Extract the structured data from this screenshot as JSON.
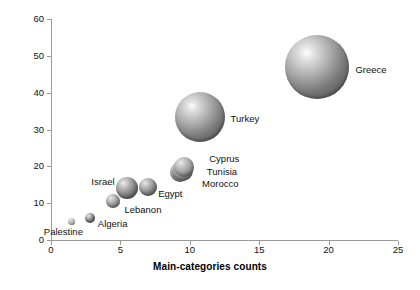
{
  "chart_data": {
    "type": "scatter",
    "title": "",
    "xlabel": "Main-categories counts",
    "ylabel": "Sub-categories counts",
    "xlim": [
      0,
      25
    ],
    "ylim": [
      0,
      60
    ],
    "xticks": [
      0,
      5,
      10,
      15,
      20,
      25
    ],
    "yticks": [
      0,
      10,
      20,
      30,
      40,
      50,
      60
    ],
    "grid": false,
    "legend": "none",
    "marker_style": "shaded-sphere-bubble",
    "points": [
      {
        "label": "Palestine",
        "x": 1.5,
        "y": 5,
        "r_px": 3.5,
        "label_dx": -28,
        "label_dy": 10,
        "shade": "#c9c9c9"
      },
      {
        "label": "Algeria",
        "x": 2.8,
        "y": 6,
        "r_px": 5.0,
        "label_dx": 8,
        "label_dy": 6,
        "shade": "#6e6e6e"
      },
      {
        "label": "Lebanon",
        "x": 4.5,
        "y": 10.5,
        "r_px": 7.0,
        "label_dx": 11,
        "label_dy": 9,
        "shade": "#8a8a8a"
      },
      {
        "label": "Israel",
        "x": 5.5,
        "y": 14,
        "r_px": 11.0,
        "label_dx": -36,
        "label_dy": -6,
        "shade": "#707070"
      },
      {
        "label": "Egypt",
        "x": 7.0,
        "y": 14.5,
        "r_px": 9.0,
        "label_dx": 10,
        "label_dy": 7,
        "shade": "#787878"
      },
      {
        "label": "Morocco",
        "x": 9.3,
        "y": 18.5,
        "r_px": 10.0,
        "label_dx": 22,
        "label_dy": 12,
        "shade": "#848484"
      },
      {
        "label": "Tunisia",
        "x": 9.5,
        "y": 19.0,
        "r_px": 10.5,
        "label_dx": 24,
        "label_dy": 2,
        "shade": "#7e7e7e"
      },
      {
        "label": "Cyprus",
        "x": 9.6,
        "y": 19.8,
        "r_px": 10.0,
        "label_dx": 25,
        "label_dy": -8,
        "shade": "#8e8e8e"
      },
      {
        "label": "Turkey",
        "x": 10.7,
        "y": 33.5,
        "r_px": 25.0,
        "label_dx": 31,
        "label_dy": 2,
        "shade": "#7a7a7a"
      },
      {
        "label": "Greece",
        "x": 19.2,
        "y": 47.0,
        "r_px": 32.0,
        "label_dx": 38,
        "label_dy": 3,
        "shade": "#787878"
      }
    ]
  },
  "axes": {
    "x_title": "Main-categories counts",
    "y_title": "Sub-categories counts"
  }
}
